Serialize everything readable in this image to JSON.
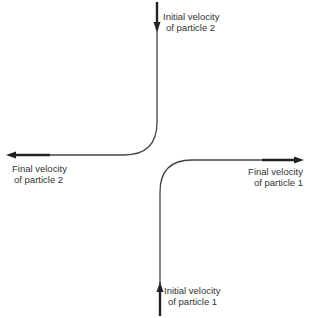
{
  "diagram": {
    "labels": {
      "initial_p2": [
        "Initial velocity",
        "of particle 2"
      ],
      "final_p2": [
        "Final velocity",
        "of particle 2"
      ],
      "final_p1": [
        "Final velocity",
        "of particle 1"
      ],
      "initial_p1": [
        "Initial velocity",
        "of particle 1"
      ]
    },
    "colors": {
      "line": "#333333",
      "text": "#333333"
    }
  }
}
